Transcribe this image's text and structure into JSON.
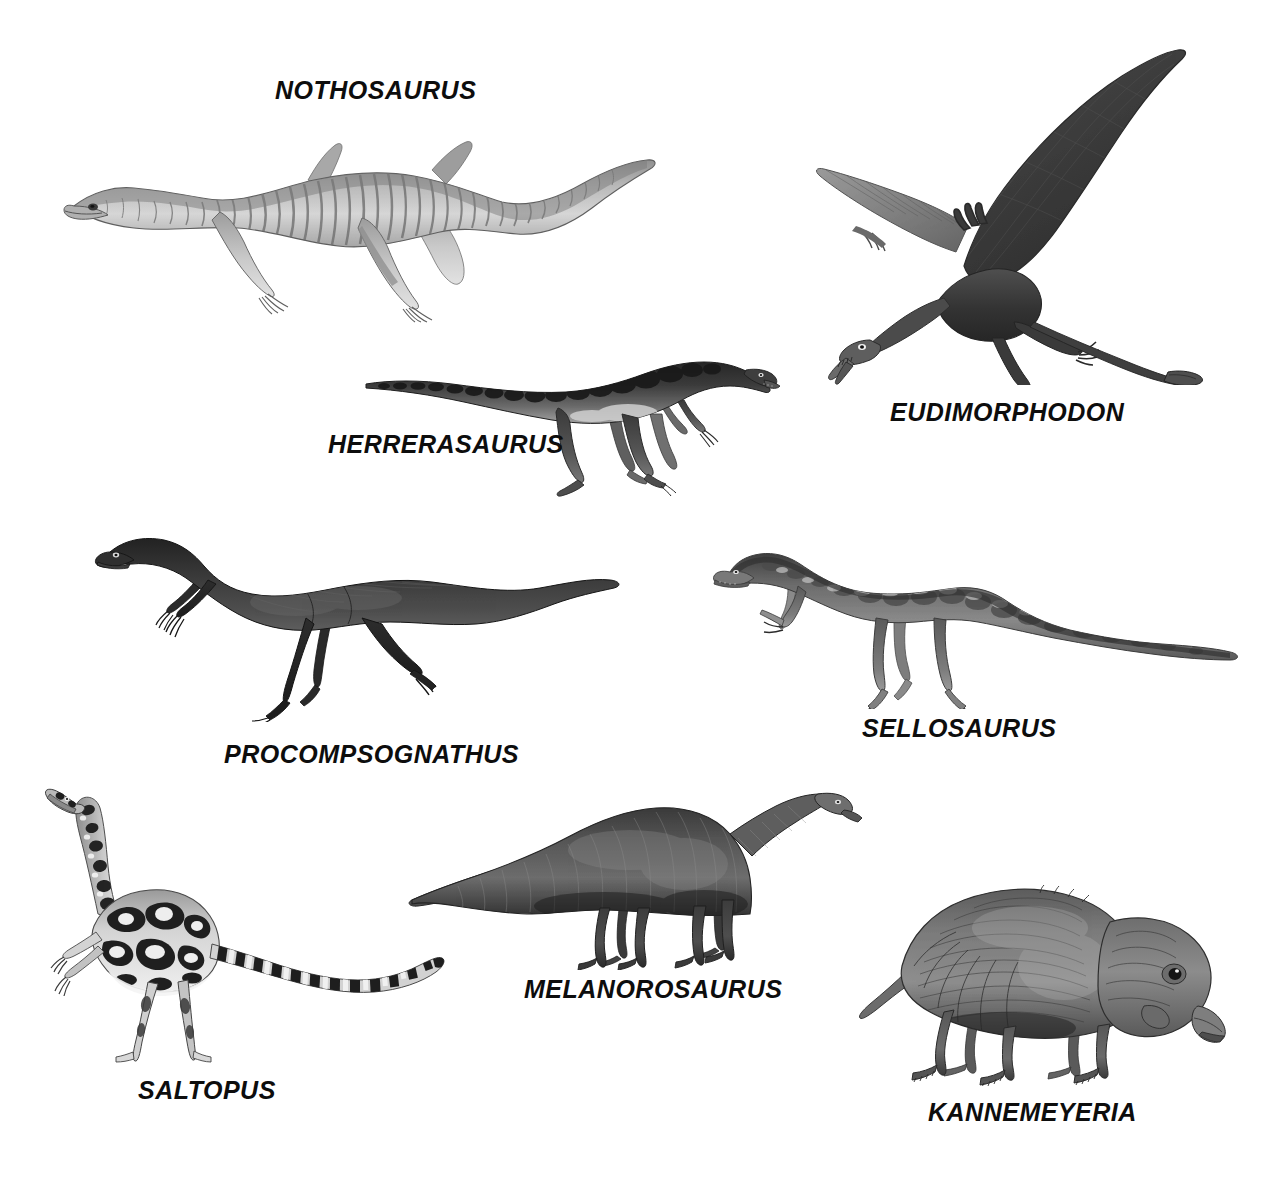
{
  "plate": {
    "title": "Triassic Reptiles Illustration Plate",
    "background_color": "#ffffff",
    "ink_color": "#0d0d0d",
    "width": 1262,
    "height": 1186,
    "style": "grayscale scientific illustration plate, eight labelled prehistoric reptiles"
  },
  "figures": [
    {
      "id": "nothosaurus",
      "label": "NOTHOSAURUS",
      "icon": "nothosaurus-illustration",
      "description": "Long-bodied aquatic nothosaur with paddle limbs, long neck and tail, banded ribcage shading",
      "orientation": "facing-left",
      "tone": "light-gray"
    },
    {
      "id": "eudimorphodon",
      "label": "EUDIMORPHODON",
      "icon": "eudimorphodon-illustration",
      "description": "Pterosaur in flight with broad dark membranous wings and long tail ending in a diamond vane",
      "orientation": "facing-left",
      "tone": "dark-gray"
    },
    {
      "id": "herrerasaurus",
      "label": "HERRERASAURUS",
      "icon": "herrerasaurus-illustration",
      "description": "Early theropod dinosaur striding, dark dorsal blotches, long tapering tail",
      "orientation": "facing-right",
      "tone": "dark-gray"
    },
    {
      "id": "procompsognathus",
      "label": "PROCOMPSOGNATHUS",
      "icon": "procompsognathus-illustration",
      "description": "Small slender bipedal theropod running, very long thin tail",
      "orientation": "facing-left",
      "tone": "dark-gray"
    },
    {
      "id": "sellosaurus",
      "label": "SELLOSAURUS",
      "icon": "sellosaurus-illustration",
      "description": "Bipedal prosauropod with mottled hide, grasping hands and long tail",
      "orientation": "facing-left",
      "tone": "mid-gray"
    },
    {
      "id": "saltopus",
      "label": "SALTOPUS",
      "icon": "saltopus-illustration",
      "description": "Tiny bipedal dinosauriform with leopard-like dark blotches and banded tail, neck held upright",
      "orientation": "facing-left",
      "tone": "spotted-light"
    },
    {
      "id": "melanorosaurus",
      "label": "MELANOROSAURUS",
      "icon": "melanorosaurus-illustration",
      "description": "Heavy quadrupedal sauropodomorph with long neck raised and long tapering tail",
      "orientation": "facing-right",
      "tone": "dark-gray"
    },
    {
      "id": "kannemeyeria",
      "label": "KANNEMEYERIA",
      "icon": "kannemeyeria-illustration",
      "description": "Stocky quadrupedal dicynodont therapsid with broad beaked head and short tail",
      "orientation": "facing-right",
      "tone": "mid-gray"
    }
  ]
}
